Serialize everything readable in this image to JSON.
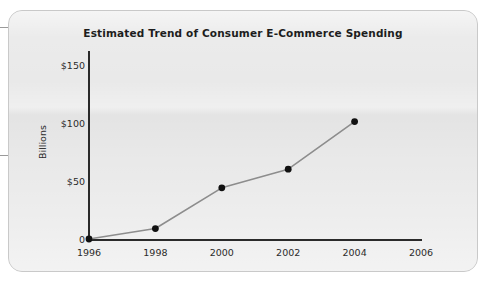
{
  "figure": {
    "title": "Estimated Trend of Consumer E-Commerce Spending",
    "y_axis_title": "Billions"
  },
  "colors": {
    "card_background": "#e9e9e9",
    "card_border": "#c9c9c9",
    "axis": "#2a2a2a",
    "series_line": "#8d8d8d",
    "series_marker": "#111111",
    "text": "#1d1d1d",
    "page_background": "#ffffff"
  },
  "chart_data": {
    "type": "line",
    "title": "Estimated Trend of Consumer E-Commerce Spending",
    "xlabel": "",
    "ylabel": "Billions",
    "x": [
      1996,
      1998,
      2000,
      2002,
      2004
    ],
    "values": [
      0,
      9,
      44,
      60,
      101
    ],
    "series": [
      {
        "name": "Consumer E-Commerce Spending",
        "values": [
          0,
          9,
          44,
          60,
          101
        ]
      }
    ],
    "xlim": [
      1996,
      2006
    ],
    "ylim": [
      0,
      160
    ],
    "xticks": [
      1996,
      1998,
      2000,
      2002,
      2004,
      2006
    ],
    "xticklabels": [
      "1996",
      "1998",
      "2000",
      "2002",
      "2004",
      "2006"
    ],
    "yticks": [
      0,
      50,
      100,
      150
    ],
    "yticklabels": [
      "0",
      "$50",
      "$100",
      "$150"
    ],
    "grid": false,
    "legend": false,
    "markers": true,
    "units": "Billions of US dollars"
  }
}
